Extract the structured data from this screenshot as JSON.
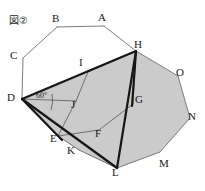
{
  "figure": {
    "tag": "図②",
    "angle_label": "60°",
    "shade_color": "#cccccc",
    "thin_stroke_color": "#777777",
    "thick_stroke_color": "#1a1a1a",
    "background": "#ffffff"
  },
  "vertices": [
    {
      "id": "A",
      "label": "A",
      "x": 104,
      "y": 26,
      "lx": 98,
      "ly": 14
    },
    {
      "id": "B",
      "label": "B",
      "x": 57,
      "y": 27,
      "lx": 52,
      "ly": 14
    },
    {
      "id": "C",
      "label": "C",
      "x": 23,
      "y": 58,
      "lx": 11,
      "ly": 52
    },
    {
      "id": "D",
      "label": "D",
      "x": 22,
      "y": 99,
      "lx": 8,
      "ly": 93
    },
    {
      "id": "E",
      "label": "E",
      "x": 58,
      "y": 136,
      "lx": 51,
      "ly": 136
    },
    {
      "id": "F",
      "label": "F",
      "x": 99,
      "y": 130,
      "lx": 96,
      "ly": 129
    },
    {
      "id": "G",
      "label": "G",
      "x": 133,
      "y": 104,
      "lx": 134,
      "ly": 95
    },
    {
      "id": "H",
      "label": "H",
      "x": 136,
      "y": 51,
      "lx": 134,
      "ly": 41
    },
    {
      "id": "I",
      "label": "I",
      "x": 88,
      "y": 72,
      "lx": 79,
      "ly": 59
    },
    {
      "id": "J",
      "label": "J",
      "x": 76,
      "y": 101,
      "lx": 72,
      "ly": 101
    },
    {
      "id": "K",
      "label": "K",
      "x": 79,
      "y": 150,
      "lx": 68,
      "ly": 148
    },
    {
      "id": "L",
      "label": "L",
      "x": 117,
      "y": 168,
      "lx": 113,
      "ly": 169
    },
    {
      "id": "M",
      "label": "M",
      "x": 160,
      "y": 152,
      "lx": 160,
      "ly": 160
    },
    {
      "id": "N",
      "label": "N",
      "x": 190,
      "y": 118,
      "lx": 189,
      "ly": 112
    },
    {
      "id": "O",
      "label": "O",
      "x": 178,
      "y": 76,
      "lx": 177,
      "ly": 68
    }
  ],
  "outer_polygon": {
    "name": "pentadecagon-outline",
    "points": "104,26 57,27 23,58 22,99 58,136 99,130 133,104 136,51 178,76 190,118 160,152 117,168"
  },
  "shaded_region": {
    "name": "folded-shaded-area",
    "points": "22,99 88,72 136,51 178,76 190,118 160,152 117,168 79,150 58,136"
  },
  "thin_edges": [
    {
      "name": "edge-A-B",
      "from": "A",
      "to": "B"
    },
    {
      "name": "edge-B-C",
      "from": "B",
      "to": "C"
    },
    {
      "name": "edge-C-D",
      "from": "C",
      "to": "D"
    },
    {
      "name": "edge-A-H",
      "from": "A",
      "to": "H"
    },
    {
      "name": "edge-H-O",
      "from": "H",
      "to": "O"
    },
    {
      "name": "edge-O-N",
      "from": "O",
      "to": "N"
    },
    {
      "name": "edge-N-M",
      "from": "N",
      "to": "M"
    },
    {
      "name": "edge-M-L",
      "from": "M",
      "to": "L"
    },
    {
      "name": "edge-D-J",
      "from": "D",
      "to": "J"
    },
    {
      "name": "edge-J-I",
      "from": "J",
      "to": "I"
    },
    {
      "name": "edge-I-H",
      "from": "I",
      "to": "H"
    },
    {
      "name": "edge-J-E",
      "from": "J",
      "to": "E"
    },
    {
      "name": "edge-E-F",
      "from": "E",
      "to": "F"
    },
    {
      "name": "edge-F-G",
      "from": "F",
      "to": "G"
    },
    {
      "name": "edge-G-H",
      "from": "G",
      "to": "H"
    },
    {
      "name": "edge-D-E",
      "from": "D",
      "to": "E"
    },
    {
      "name": "edge-E-K",
      "from": "E",
      "to": "K"
    },
    {
      "name": "edge-K-L",
      "from": "K",
      "to": "L"
    }
  ],
  "thick_edges": [
    {
      "name": "fold-edge-D-H",
      "from": "D",
      "to": "H"
    },
    {
      "name": "fold-edge-H-L",
      "from": "H",
      "to": "L"
    },
    {
      "name": "fold-edge-D-L",
      "from": "D",
      "to": "L"
    },
    {
      "name": "fold-edge-D-E-crease",
      "from": "D",
      "to": "E"
    },
    {
      "name": "fold-edge-H-G-crease",
      "from": "H",
      "to": "G"
    }
  ],
  "angle_marker": {
    "name": "angle-60-at-D",
    "vertex": "D",
    "label": "60°",
    "label_x": 38,
    "label_y": 92
  }
}
